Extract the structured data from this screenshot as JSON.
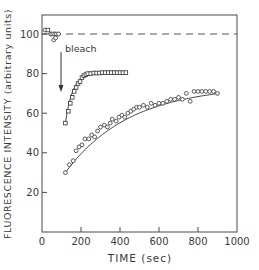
{
  "chart_data": {
    "type": "scatter",
    "title": "",
    "xlabel": "TIME (sec)",
    "ylabel": "FLUORESCENCE INTENSITY (arbitrary units)",
    "xlim": [
      0,
      1000
    ],
    "ylim": [
      0,
      110
    ],
    "xticks": [
      0,
      200,
      400,
      600,
      800,
      1000
    ],
    "yticks": [
      20,
      40,
      60,
      80,
      100
    ],
    "grid": false,
    "legend": null,
    "reference_line": {
      "y": 100,
      "style": "dashed"
    },
    "annotations": [
      {
        "text": "bleach",
        "x": 110,
        "y": 90,
        "arrow_to": {
          "x": 110,
          "y": 67
        }
      }
    ],
    "series": [
      {
        "name": "pre-bleach",
        "marker": "square/circle",
        "x": [
          15,
          30,
          45,
          55,
          65,
          75,
          85,
          60,
          70
        ],
        "y": [
          102,
          102,
          100,
          100,
          100,
          100,
          100,
          97,
          98
        ]
      },
      {
        "name": "fast recovery",
        "marker": "square",
        "fit_line": true,
        "x": [
          120,
          135,
          145,
          155,
          165,
          175,
          185,
          195,
          205,
          215,
          225,
          235,
          250,
          265,
          280,
          295,
          310,
          325,
          340,
          355,
          370,
          385,
          400,
          415,
          430
        ],
        "y": [
          55,
          61,
          65,
          68,
          71,
          73,
          75,
          76,
          78,
          79,
          79.5,
          80,
          80,
          80.3,
          80.3,
          80.3,
          80.5,
          80.5,
          80.5,
          80.5,
          80.5,
          80.5,
          80.5,
          80.5,
          80.5
        ]
      },
      {
        "name": "slow recovery",
        "marker": "circle",
        "fit_line": true,
        "x": [
          120,
          140,
          160,
          175,
          190,
          205,
          220,
          240,
          255,
          270,
          285,
          300,
          320,
          335,
          350,
          360,
          380,
          395,
          410,
          425,
          440,
          455,
          470,
          485,
          500,
          520,
          540,
          560,
          580,
          600,
          620,
          640,
          660,
          680,
          700,
          720,
          740,
          760,
          780,
          800,
          820,
          840,
          860,
          880,
          900
        ],
        "y": [
          30,
          34,
          36,
          41,
          43,
          44,
          47,
          47,
          49,
          48,
          51,
          53,
          54,
          53,
          55,
          57,
          56,
          58,
          59,
          58,
          60,
          61,
          62,
          63,
          63,
          64,
          63,
          65,
          64,
          65,
          65,
          66,
          67,
          67,
          68,
          67,
          70,
          66,
          71,
          71,
          71,
          71,
          71,
          71,
          70
        ]
      }
    ]
  }
}
